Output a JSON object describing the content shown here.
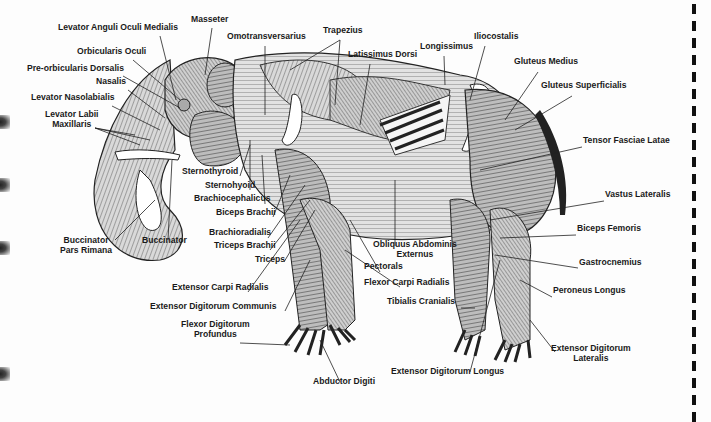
{
  "figure": {
    "labels": [
      {
        "id": "levator-anguli-oculi-medialis",
        "text": "Levator Anguli Oculi Medialis",
        "x": 58,
        "y": 30
      },
      {
        "id": "masseter",
        "text": "Masseter",
        "x": 191,
        "y": 22
      },
      {
        "id": "orbicularis-oculi",
        "text": "Orbicularis Oculi",
        "x": 77,
        "y": 54
      },
      {
        "id": "pre-orbicularis-dorsalis",
        "text": "Pre-orbicularis Dorsalis",
        "x": 27,
        "y": 71
      },
      {
        "id": "nasalis",
        "text": "Nasalis",
        "x": 96,
        "y": 84
      },
      {
        "id": "levator-nasolabialis",
        "text": "Levator Nasolabialis",
        "x": 31,
        "y": 100
      },
      {
        "id": "levator-labii-maxillaris",
        "text": "Levator Labii\nMaxillaris",
        "x": 45,
        "y": 117,
        "center": true
      },
      {
        "id": "omotransversarius",
        "text": "Omotransversarius",
        "x": 227,
        "y": 39
      },
      {
        "id": "trapezius",
        "text": "Trapezius",
        "x": 323,
        "y": 33
      },
      {
        "id": "latissimus-dorsi",
        "text": "Latissimus Dorsi",
        "x": 348,
        "y": 57
      },
      {
        "id": "longissimus",
        "text": "Longissimus",
        "x": 420,
        "y": 49
      },
      {
        "id": "iliocostalis",
        "text": "Iliocostalis",
        "x": 474,
        "y": 39
      },
      {
        "id": "gluteus-medius",
        "text": "Gluteus Medius",
        "x": 514,
        "y": 64
      },
      {
        "id": "gluteus-superficialis",
        "text": "Gluteus Superficialis",
        "x": 541,
        "y": 88
      },
      {
        "id": "tensor-fasciae-latae",
        "text": "Tensor Fasciae Latae",
        "x": 583,
        "y": 143
      },
      {
        "id": "vastus-lateralis",
        "text": "Vastus Lateralis",
        "x": 605,
        "y": 197
      },
      {
        "id": "biceps-femoris",
        "text": "Biceps Femoris",
        "x": 577,
        "y": 231
      },
      {
        "id": "gastrocnemius",
        "text": "Gastrocnemius",
        "x": 579,
        "y": 265
      },
      {
        "id": "peroneus-longus",
        "text": "Peroneus Longus",
        "x": 553,
        "y": 293
      },
      {
        "id": "tibialis-cranialis",
        "text": "Tibialis Cranialis",
        "x": 387,
        "y": 304
      },
      {
        "id": "extensor-digitorum-lateralis",
        "text": "Extensor Digitorum\nLateralis",
        "x": 551,
        "y": 351,
        "center": true
      },
      {
        "id": "extensor-digitorum-longus",
        "text": "Extensor Digitorum Longus",
        "x": 391,
        "y": 374
      },
      {
        "id": "sternothyroid",
        "text": "Sternothyroid",
        "x": 182,
        "y": 174
      },
      {
        "id": "sternohyoid",
        "text": "Sternohyoid",
        "x": 205,
        "y": 188
      },
      {
        "id": "brachiocephalicus",
        "text": "Brachiocephalicus",
        "x": 194,
        "y": 201
      },
      {
        "id": "biceps-brachii",
        "text": "Biceps Brachii",
        "x": 216,
        "y": 215
      },
      {
        "id": "brachioradialis",
        "text": "Brachioradialis",
        "x": 209,
        "y": 235
      },
      {
        "id": "triceps-brachii",
        "text": "Triceps Brachii",
        "x": 214,
        "y": 248
      },
      {
        "id": "triceps",
        "text": "Triceps",
        "x": 255,
        "y": 262
      },
      {
        "id": "buccinator-pars-rimana",
        "text": "Buccinator\nPars Rimana",
        "x": 60,
        "y": 243,
        "center": true
      },
      {
        "id": "buccinator",
        "text": "Buccinator",
        "x": 142,
        "y": 243
      },
      {
        "id": "obliquus-abdominis-externus",
        "text": "Obliquus Abdominis\nExternus",
        "x": 373,
        "y": 247,
        "center": true
      },
      {
        "id": "pectorals",
        "text": "Pectorals",
        "x": 364,
        "y": 269
      },
      {
        "id": "flexor-carpi-radialis",
        "text": "Flexor Carpi Radialis",
        "x": 364,
        "y": 285
      },
      {
        "id": "extensor-carpi-radialis",
        "text": "Extensor Carpi Radialis",
        "x": 172,
        "y": 290
      },
      {
        "id": "extensor-digitorum-communis",
        "text": "Extensor Digitorum Communis",
        "x": 150,
        "y": 309
      },
      {
        "id": "flexor-digitorum-profundus",
        "text": "Flexor Digitorum\nProfundus",
        "x": 181,
        "y": 327,
        "center": true
      },
      {
        "id": "abductor-digiti",
        "text": "Abductor Digiti",
        "x": 313,
        "y": 384
      }
    ]
  },
  "page_edge": {
    "binding_holes_y": [
      120,
      183,
      246,
      372
    ],
    "cut_line_x": 692
  }
}
